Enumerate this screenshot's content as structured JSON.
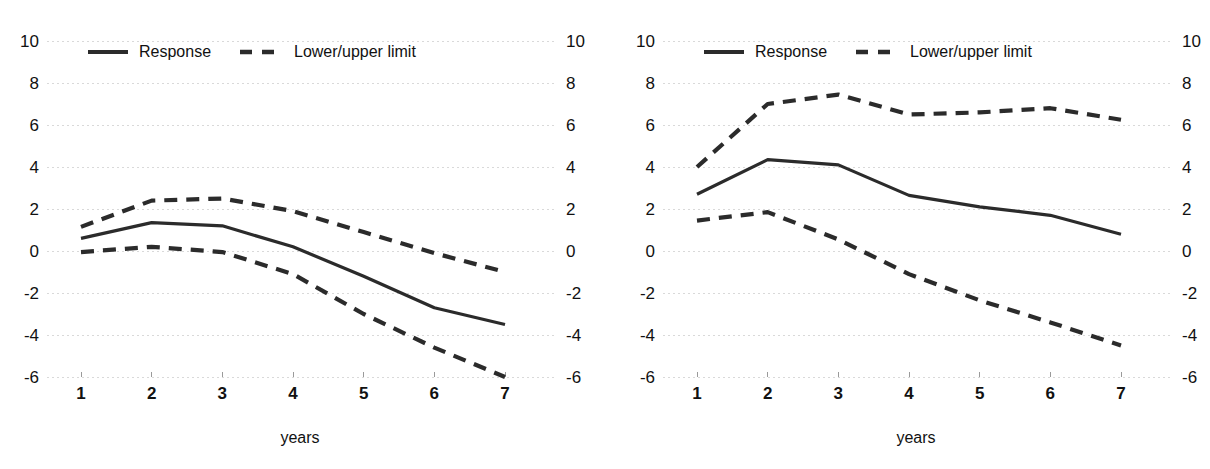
{
  "figure": {
    "background_color": "#ffffff",
    "line_color": "#2b2b2b",
    "grid_color": "#d9d9d9",
    "panel_count": 2
  },
  "legend": {
    "response_label": "Response",
    "limit_label": "Lower/upper limit"
  },
  "axes": {
    "xlabel": "years",
    "y_ticks": [
      "10",
      "8",
      "6",
      "4",
      "2",
      "0",
      "-2",
      "-4",
      "-6"
    ],
    "x_ticks": [
      "1",
      "2",
      "3",
      "4",
      "5",
      "6",
      "7"
    ]
  },
  "chart_data": [
    {
      "type": "line",
      "title": "",
      "subtitle": "",
      "xlabel": "years",
      "ylabel": "",
      "xlim": [
        1,
        7
      ],
      "ylim": [
        -6,
        10
      ],
      "x": [
        1,
        2,
        3,
        4,
        5,
        6,
        7
      ],
      "xtick_labels": [
        "1",
        "2",
        "3",
        "4",
        "5",
        "6",
        "7"
      ],
      "ytick_values": [
        10,
        8,
        6,
        4,
        2,
        0,
        -2,
        -4,
        -6
      ],
      "ytick_labels": [
        "10",
        "8",
        "6",
        "4",
        "2",
        "0",
        "-2",
        "-4",
        "-6"
      ],
      "grid": true,
      "grid_axis": "y",
      "legend_position": "top-left",
      "series": [
        {
          "name": "Response",
          "style": "solid",
          "values": [
            0.6,
            1.35,
            1.2,
            0.2,
            -1.2,
            -2.7,
            -3.5
          ]
        },
        {
          "name": "Upper limit",
          "style": "dashed",
          "values": [
            1.15,
            2.4,
            2.5,
            1.9,
            0.9,
            -0.1,
            -1.0
          ]
        },
        {
          "name": "Lower limit",
          "style": "dashed",
          "values": [
            -0.05,
            0.2,
            -0.05,
            -1.1,
            -3.0,
            -4.6,
            -6.0
          ]
        }
      ],
      "legend_entries": [
        "Response",
        "Lower/upper limit"
      ]
    },
    {
      "type": "line",
      "title": "",
      "subtitle": "",
      "xlabel": "years",
      "ylabel": "",
      "xlim": [
        1,
        7
      ],
      "ylim": [
        -6,
        10
      ],
      "x": [
        1,
        2,
        3,
        4,
        5,
        6,
        7
      ],
      "xtick_labels": [
        "1",
        "2",
        "3",
        "4",
        "5",
        "6",
        "7"
      ],
      "ytick_values": [
        10,
        8,
        6,
        4,
        2,
        0,
        -2,
        -4,
        -6
      ],
      "ytick_labels": [
        "10",
        "8",
        "6",
        "4",
        "2",
        "0",
        "-2",
        "-4",
        "-6"
      ],
      "grid": true,
      "grid_axis": "y",
      "legend_position": "top-left",
      "series": [
        {
          "name": "Response",
          "style": "solid",
          "values": [
            2.7,
            4.35,
            4.1,
            2.65,
            2.1,
            1.7,
            0.8
          ]
        },
        {
          "name": "Upper limit",
          "style": "dashed",
          "values": [
            4.0,
            7.0,
            7.45,
            6.5,
            6.6,
            6.8,
            6.25
          ]
        },
        {
          "name": "Lower limit",
          "style": "dashed",
          "values": [
            1.45,
            1.85,
            0.55,
            -1.1,
            -2.35,
            -3.4,
            -4.5
          ]
        }
      ],
      "legend_entries": [
        "Response",
        "Lower/upper limit"
      ]
    }
  ]
}
